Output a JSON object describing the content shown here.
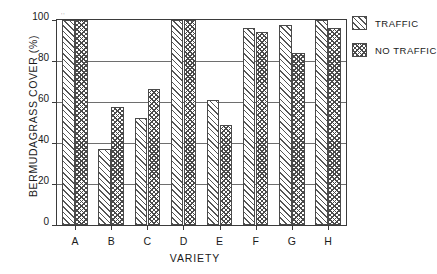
{
  "chart_data": {
    "type": "bar",
    "title": "",
    "xlabel": "VARIETY",
    "ylabel": "BERMUDAGRASS COVER (%)",
    "categories": [
      "A",
      "B",
      "C",
      "D",
      "E",
      "F",
      "G",
      "H"
    ],
    "series": [
      {
        "name": "TRAFFIC",
        "values": [
          100,
          37,
          52,
          100,
          61,
          96,
          97.5,
          100
        ]
      },
      {
        "name": "NO TRAFFIC",
        "values": [
          100,
          57.5,
          66.5,
          100,
          49,
          94,
          84,
          96
        ]
      }
    ],
    "ylim": [
      0,
      100
    ],
    "yticks": [
      0,
      20,
      40,
      60,
      80,
      100
    ],
    "ytick_labels": [
      "0",
      "20",
      "40",
      "60",
      "80",
      "100"
    ],
    "grid": true,
    "grid_axis": "y",
    "legend_position": "right-top",
    "bar_fill": {
      "TRAFFIC": "diagonal-hatch",
      "NO TRAFFIC": "cross-hatch"
    },
    "colors": {
      "axis": "#3b3b3b",
      "grid": "#6e6e6e",
      "bar_edge": "#4a4a4a",
      "background": "#ffffff"
    }
  },
  "legend": {
    "items": [
      {
        "label": "TRAFFIC",
        "swatch": "diagonal-hatch-swatch"
      },
      {
        "label": "NO TRAFFIC",
        "swatch": "cross-hatch-swatch"
      }
    ]
  },
  "artifacts": {
    "smudge_text": "''"
  }
}
